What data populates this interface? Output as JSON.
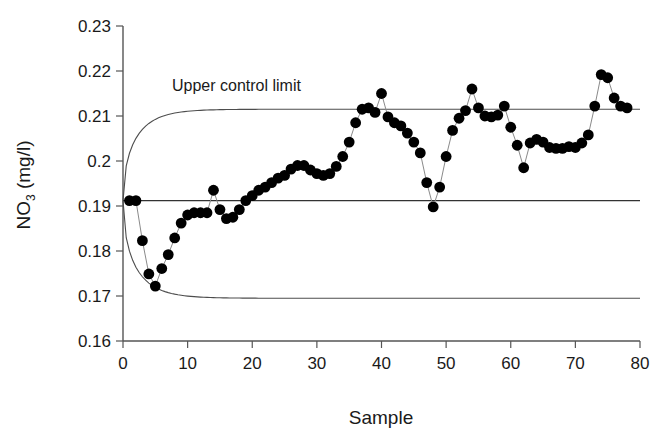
{
  "chart_data": {
    "type": "line",
    "title": "",
    "xlabel": "Sample",
    "ylabel": "NO3 (mg/l)",
    "ylabel_base": "NO",
    "ylabel_sub": "3",
    "ylabel_unit": " (mg/l)",
    "xlim": [
      0,
      80
    ],
    "ylim": [
      0.16,
      0.23
    ],
    "xticks": [
      0,
      10,
      20,
      30,
      40,
      50,
      60,
      70,
      80
    ],
    "xtick_labels": [
      "0",
      "10",
      "20",
      "30",
      "40",
      "50",
      "60",
      "70",
      "80"
    ],
    "yticks": [
      0.16,
      0.17,
      0.18,
      0.19,
      0.2,
      0.21,
      0.22,
      0.23
    ],
    "ytick_labels": [
      "0.16",
      "0.17",
      "0.18",
      "0.19",
      "0.2",
      "0.21",
      "0.22",
      "0.23"
    ],
    "grid": false,
    "legend": "none",
    "marker": "filled-circle",
    "marker_color": "#000000",
    "line_color": "#808080",
    "limit_color": "#4d4d4d",
    "center_line_color": "#333333",
    "annotations": [
      {
        "text": "Upper control limit",
        "x": 12,
        "y": 0.2155,
        "name": "upper-control-limit-label"
      }
    ],
    "center_line": {
      "label": "center line",
      "value": 0.1912
    },
    "upper_control_limit": {
      "label": "Upper control limit",
      "asymptote": 0.2115,
      "start": 0.1912
    },
    "lower_control_limit": {
      "label": "Lower control limit",
      "asymptote": 0.1695,
      "start": 0.1912
    },
    "series": [
      {
        "name": "NO3 measurement",
        "x": [
          1,
          2,
          3,
          4,
          5,
          6,
          7,
          8,
          9,
          10,
          11,
          12,
          13,
          14,
          15,
          16,
          17,
          18,
          19,
          20,
          21,
          22,
          23,
          24,
          25,
          26,
          27,
          28,
          29,
          30,
          31,
          32,
          33,
          34,
          35,
          36,
          37,
          38,
          39,
          40,
          41,
          42,
          43,
          44,
          45,
          46,
          47,
          48,
          49,
          50,
          51,
          52,
          53,
          54,
          55,
          56,
          57,
          58,
          59,
          60,
          61,
          62,
          63,
          64,
          65,
          66,
          67,
          68,
          69,
          70,
          71,
          72,
          73,
          74,
          75,
          76,
          77,
          78
        ],
        "values": [
          0.1912,
          0.1912,
          0.1823,
          0.1749,
          0.1722,
          0.1761,
          0.1792,
          0.1829,
          0.1862,
          0.188,
          0.1885,
          0.1885,
          0.1885,
          0.1935,
          0.1892,
          0.1872,
          0.1875,
          0.1892,
          0.1912,
          0.1923,
          0.1935,
          0.1942,
          0.1952,
          0.1962,
          0.1968,
          0.1982,
          0.199,
          0.199,
          0.198,
          0.1972,
          0.1968,
          0.1972,
          0.1988,
          0.201,
          0.2042,
          0.2085,
          0.2115,
          0.2118,
          0.2108,
          0.215,
          0.2098,
          0.2085,
          0.2078,
          0.2062,
          0.2042,
          0.2018,
          0.1952,
          0.1898,
          0.1942,
          0.201,
          0.2068,
          0.2095,
          0.2112,
          0.216,
          0.2118,
          0.21,
          0.2098,
          0.2102,
          0.2122,
          0.2075,
          0.2035,
          0.1985,
          0.204,
          0.2048,
          0.2042,
          0.203,
          0.2028,
          0.2028,
          0.2032,
          0.203,
          0.204,
          0.2058,
          0.2122,
          0.2192,
          0.2185,
          0.214,
          0.2122,
          0.2118
        ]
      }
    ]
  },
  "figure": {
    "background": "#ffffff",
    "frame_color": "#555555",
    "width": 671,
    "height": 445
  }
}
